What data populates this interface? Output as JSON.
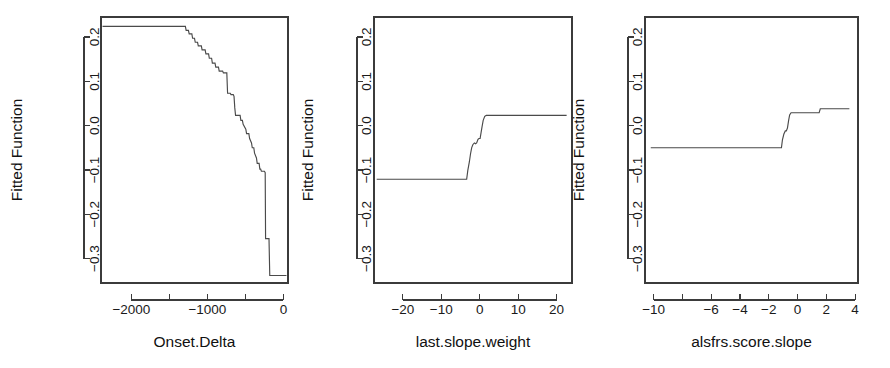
{
  "figure": {
    "background_color": "#ffffff",
    "line_color": "#4a4a4a",
    "axis_color": "#3b3b3b",
    "panel_count": 3
  },
  "chart_data": [
    {
      "type": "line",
      "title": "",
      "xlabel": "Onset.Delta",
      "ylabel": "Fitted Function",
      "xlim": [
        -2400,
        60
      ],
      "ylim": [
        -0.355,
        0.245
      ],
      "grid": false,
      "legend": "none",
      "xticks": [
        -2000,
        -1500,
        -1000,
        -500,
        0
      ],
      "xtick_labels": [
        "-2000",
        "",
        "-1000",
        "",
        "0"
      ],
      "yticks": [
        0.2,
        0.1,
        0.0,
        -0.1,
        -0.2,
        -0.3
      ],
      "ytick_labels": [
        "0.2",
        "0.1",
        "0.0",
        "-0.1",
        "-0.2",
        "-0.3"
      ],
      "x": [
        -2380,
        -1290,
        -1280,
        -1250,
        -1240,
        -1205,
        -1195,
        -1170,
        -1160,
        -1130,
        -1120,
        -1080,
        -1070,
        -1030,
        -1020,
        -985,
        -975,
        -945,
        -935,
        -900,
        -890,
        -855,
        -845,
        -800,
        -790,
        -745,
        -735,
        -700,
        -690,
        -660,
        -650,
        -640,
        -630,
        -570,
        -560,
        -540,
        -530,
        -495,
        -485,
        -455,
        -445,
        -420,
        -410,
        -390,
        -380,
        -355,
        -345,
        -320,
        -310,
        -300,
        -290,
        -250,
        -240,
        -235,
        -190,
        -180,
        40
      ],
      "y": [
        0.224,
        0.224,
        0.215,
        0.215,
        0.207,
        0.207,
        0.197,
        0.197,
        0.188,
        0.188,
        0.18,
        0.18,
        0.171,
        0.171,
        0.162,
        0.162,
        0.152,
        0.152,
        0.141,
        0.141,
        0.132,
        0.132,
        0.123,
        0.123,
        0.119,
        0.119,
        0.073,
        0.073,
        0.07,
        0.07,
        0.066,
        0.04,
        0.023,
        0.023,
        0.012,
        0.012,
        0.003,
        -0.008,
        -0.018,
        -0.018,
        -0.029,
        -0.039,
        -0.05,
        -0.05,
        -0.062,
        -0.073,
        -0.085,
        -0.085,
        -0.098,
        -0.098,
        -0.103,
        -0.103,
        -0.106,
        -0.255,
        -0.255,
        -0.338,
        -0.338
      ]
    },
    {
      "type": "line",
      "title": "",
      "xlabel": "last.slope.weight",
      "ylabel": "Fitted Function",
      "xlim": [
        -27.5,
        24
      ],
      "ylim": [
        -0.355,
        0.245
      ],
      "grid": false,
      "legend": "none",
      "xticks": [
        -20,
        -10,
        0,
        10,
        20
      ],
      "xtick_labels": [
        "-20",
        "-10",
        "0",
        "10",
        "20"
      ],
      "yticks": [
        0.2,
        0.1,
        0.0,
        -0.1,
        -0.2,
        -0.3
      ],
      "ytick_labels": [
        "0.2",
        "0.1",
        "0.0",
        "-0.1",
        "-0.2",
        "-0.3"
      ],
      "x": [
        -26.8,
        -3.4,
        -3.1,
        -2.7,
        -2.4,
        -2.1,
        -1.8,
        -1.4,
        -1.1,
        -0.8,
        -0.45,
        -0.2,
        0.1,
        0.35,
        0.6,
        0.9,
        1.3,
        1.7,
        22.6
      ],
      "y": [
        -0.121,
        -0.121,
        -0.101,
        -0.082,
        -0.064,
        -0.05,
        -0.043,
        -0.039,
        -0.041,
        -0.039,
        -0.031,
        -0.029,
        -0.029,
        -0.016,
        -0.003,
        0.012,
        0.021,
        0.023,
        0.023
      ]
    },
    {
      "type": "line",
      "title": "",
      "xlabel": "alsfrs.score.slope",
      "ylabel": "Fitted Function",
      "xlim": [
        -10.6,
        4.2
      ],
      "ylim": [
        -0.355,
        0.245
      ],
      "grid": false,
      "legend": "none",
      "xticks": [
        -10,
        -8,
        -6,
        -4,
        -2,
        0,
        2,
        4
      ],
      "xtick_labels": [
        "-10",
        "",
        "-6",
        "-4",
        "-2",
        "0",
        "2",
        "4"
      ],
      "yticks": [
        0.2,
        0.1,
        0.0,
        -0.1,
        -0.2,
        -0.3
      ],
      "ytick_labels": [
        "0.2",
        "0.1",
        "0.0",
        "-0.1",
        "-0.2",
        "-0.3"
      ],
      "x": [
        -10.2,
        -1.12,
        -1.05,
        -0.95,
        -0.85,
        -0.78,
        -0.7,
        -0.62,
        -0.55,
        -0.45,
        -0.38,
        1.5,
        1.58,
        3.6
      ],
      "y": [
        -0.05,
        -0.05,
        -0.032,
        -0.019,
        -0.012,
        -0.012,
        -0.005,
        0.012,
        0.024,
        0.029,
        0.029,
        0.029,
        0.038,
        0.038
      ]
    }
  ]
}
